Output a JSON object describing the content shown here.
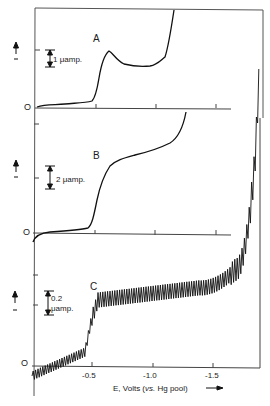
{
  "chart_data": {
    "type": "line",
    "title": "",
    "xlabel": "E, Volts (vs. Hg pool)",
    "xlabel_parts": {
      "prefix": "E, Volts (",
      "italic": "vs.",
      "suffix": " Hg pool)"
    },
    "ylabel": "current (arrow up)",
    "x_ticks": [
      "-0.5",
      "-1.0",
      "-1.5"
    ],
    "xlim": [
      0.0,
      -1.9
    ],
    "grid": false,
    "panels": [
      {
        "label": "A",
        "zero_label": "O",
        "scale_bar": "1 μamp.",
        "scale_text": "1 μamp.",
        "description": "Wave rising near -0.5 V with peak at ~-0.6 V, then plateau, then sharp rise near -1.2 V",
        "x": [
          0.0,
          -0.1,
          -0.2,
          -0.3,
          -0.4,
          -0.45,
          -0.5,
          -0.55,
          -0.6,
          -0.65,
          -0.7,
          -0.8,
          -0.9,
          -1.0,
          -1.05,
          -1.1,
          -1.15,
          -1.2,
          -1.25
        ],
        "y": [
          0.05,
          0.08,
          0.12,
          0.15,
          0.2,
          0.3,
          1.0,
          2.1,
          2.4,
          2.2,
          2.0,
          1.8,
          1.7,
          1.75,
          1.85,
          2.1,
          2.8,
          4.0,
          5.5
        ]
      },
      {
        "label": "B",
        "zero_label": "O",
        "scale_bar": "2 μamp.",
        "scale_text": "2 μamp.",
        "description": "Smooth S-shaped wave with half-wave near -0.55 V, sloping plateau rising to ~-1.25 V",
        "x": [
          0.0,
          -0.1,
          -0.2,
          -0.3,
          -0.4,
          -0.45,
          -0.5,
          -0.55,
          -0.6,
          -0.65,
          -0.7,
          -0.8,
          -0.9,
          -1.0,
          -1.1,
          -1.2,
          -1.25
        ],
        "y": [
          -0.5,
          0.1,
          0.2,
          0.3,
          0.4,
          0.6,
          1.5,
          3.0,
          4.2,
          4.8,
          5.1,
          5.4,
          5.7,
          6.0,
          6.4,
          7.0,
          8.0
        ]
      },
      {
        "label": "C",
        "zero_label": "O",
        "scale_bar": "0.2 μamp.",
        "scale_text_1": "0.2",
        "scale_text_2": "μamp.",
        "description": "Oscillating polarogram (dropping mercury electrode) with wave near -0.5 V, plateau, and final rise near -1.8 V",
        "x": [
          0.0,
          -0.1,
          -0.2,
          -0.3,
          -0.4,
          -0.45,
          -0.5,
          -0.55,
          -0.6,
          -0.8,
          -1.0,
          -1.2,
          -1.4,
          -1.6,
          -1.7,
          -1.8,
          -1.85
        ],
        "y": [
          -0.3,
          -0.2,
          -0.1,
          0.0,
          0.15,
          0.3,
          0.9,
          1.6,
          1.8,
          1.9,
          1.95,
          2.0,
          2.1,
          2.4,
          2.8,
          4.0,
          6.0
        ]
      }
    ]
  }
}
